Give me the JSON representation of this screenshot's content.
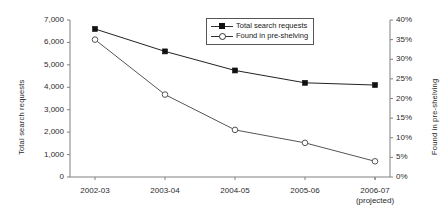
{
  "chart_data": {
    "type": "line",
    "title": "",
    "categories": [
      "2002-03",
      "2003-04",
      "2004-05",
      "2005-06",
      "2006-07"
    ],
    "category_sublabels": [
      "",
      "",
      "",
      "",
      "(projected)"
    ],
    "series": [
      {
        "name": "Total search requests",
        "axis": "left",
        "marker": "filled-square",
        "values": [
          6600,
          5600,
          4750,
          4200,
          4100
        ]
      },
      {
        "name": "Found in pre-shelving",
        "axis": "right",
        "marker": "open-circle",
        "values": [
          35,
          21,
          12,
          8.7,
          4
        ]
      }
    ],
    "xlabel": "",
    "ylabel": "Total search requests",
    "y2label": "Found in pre-shelving",
    "ylim": [
      0,
      7000
    ],
    "y2lim": [
      0,
      40
    ],
    "yticks": [
      0,
      1000,
      2000,
      3000,
      4000,
      5000,
      6000,
      7000
    ],
    "ytick_labels": [
      "0",
      "1,000",
      "2,000",
      "3,000",
      "4,000",
      "5,000",
      "6,000",
      "7,000"
    ],
    "y2ticks": [
      0,
      5,
      10,
      15,
      20,
      25,
      30,
      35,
      40
    ],
    "y2tick_labels": [
      "0%",
      "5%",
      "10%",
      "15%",
      "20%",
      "25%",
      "30%",
      "35%",
      "40%"
    ],
    "grid": false,
    "legend_position": "top-center",
    "colors": {
      "axis": "#808080",
      "series_total": "#222222",
      "series_found": "#555555",
      "background": "#ffffff"
    }
  },
  "legend": {
    "items": [
      {
        "label": "Total search requests"
      },
      {
        "label": "Found in pre-shelving"
      }
    ]
  },
  "axes": {
    "left_title": "Total search requests",
    "right_title": "Found in pre-shelving"
  }
}
